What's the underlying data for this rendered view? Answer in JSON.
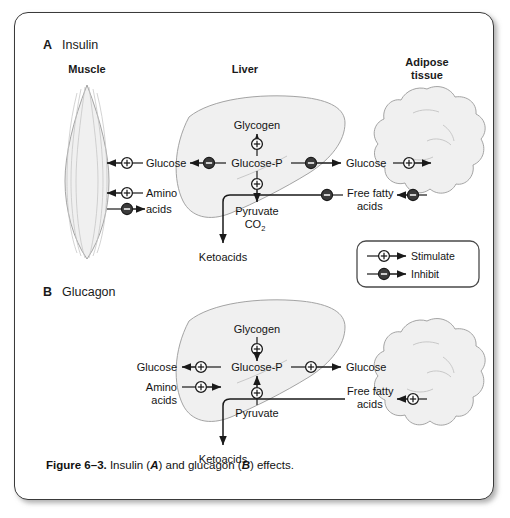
{
  "figure": {
    "caption_prefix": "Figure 6–3.",
    "caption_mid_1": " Insulin (",
    "caption_em_1": "A",
    "caption_mid_2": ") and glucagon (",
    "caption_em_2": "B",
    "caption_end": ") effects."
  },
  "legend": {
    "stimulate": "Stimulate",
    "inhibit": "Inhibit"
  },
  "panel_a": {
    "letter": "A",
    "title": "Insulin",
    "tissues": {
      "muscle": "Muscle",
      "liver": "Liver",
      "adipose_line1": "Adipose",
      "adipose_line2": "tissue"
    },
    "nodes": {
      "muscle_glucose": "Glucose",
      "amino_line1": "Amino",
      "amino_line2": "acids",
      "glycogen": "Glycogen",
      "glucose_p": "Glucose-P",
      "pyruvate": "Pyruvate",
      "co2": "CO",
      "co2_sub": "2",
      "ketoacids": "Ketoacids",
      "adipose_glucose": "Glucose",
      "ffa_line1": "Free fatty",
      "ffa_line2": "acids"
    }
  },
  "panel_b": {
    "letter": "B",
    "title": "Glucagon",
    "nodes": {
      "muscle_glucose": "Glucose",
      "amino_line1": "Amino",
      "amino_line2": "acids",
      "glycogen": "Glycogen",
      "glucose_p": "Glucose-P",
      "pyruvate": "Pyruvate",
      "ketoacids": "Ketoacids",
      "adipose_glucose": "Glucose",
      "ffa_line1": "Free fatty",
      "ffa_line2": "acids"
    }
  },
  "colors": {
    "ink": "#1a1a1a",
    "organ_fill": "#f0f0f0",
    "organ_stroke": "#9a9a9a",
    "inhibit_fill": "#3b3b3b",
    "frame_stroke": "#3a3a3a"
  }
}
